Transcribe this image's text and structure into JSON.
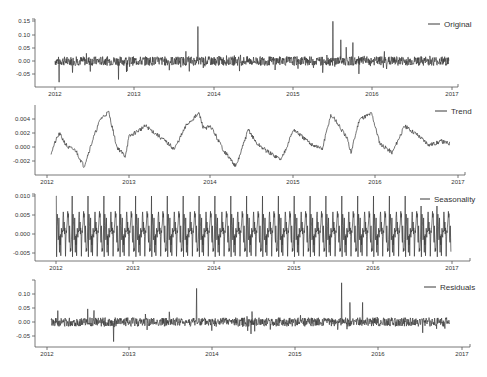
{
  "chart_data": [
    {
      "type": "line",
      "title": "",
      "legend": [
        "Original"
      ],
      "legend_position": "upper right",
      "xlabel": "",
      "ylabel": "",
      "x_ticks": [
        "2012",
        "2013",
        "2014",
        "2015",
        "2016",
        "2017"
      ],
      "y_ticks": [
        "0.15",
        "0.10",
        "0.05",
        "0.00",
        "-0.05"
      ],
      "ylim": [
        -0.09,
        0.16
      ],
      "grid": false,
      "description": "Noisy daily series centered at 0.00, mostly within ±0.03; spikes at ~2012.05 (-0.08), ~2012.8 (-0.07), ~2013.8 (+0.13), ~2015.5 (+0.15), ~2015.6 (+0.08), ~2015.75 (+0.07)",
      "series": [
        {
          "name": "Original",
          "x": [
            2012.0,
            2012.05,
            2012.3,
            2012.6,
            2012.8,
            2013.0,
            2013.3,
            2013.6,
            2013.8,
            2014.0,
            2014.3,
            2014.6,
            2015.0,
            2015.3,
            2015.5,
            2015.6,
            2015.75,
            2016.0,
            2016.3,
            2016.6,
            2016.9
          ],
          "values": [
            0.0,
            -0.08,
            0.01,
            0.02,
            -0.07,
            0.0,
            0.01,
            0.0,
            0.13,
            0.0,
            -0.02,
            0.01,
            0.0,
            0.01,
            0.15,
            0.08,
            0.07,
            0.0,
            0.01,
            -0.02,
            0.0
          ]
        }
      ]
    },
    {
      "type": "line",
      "title": "",
      "legend": [
        "Trend"
      ],
      "legend_position": "upper right",
      "x_ticks": [
        "2012",
        "2013",
        "2014",
        "2015",
        "2016",
        "2017"
      ],
      "y_ticks": [
        "0.004",
        "0.002",
        "0.000",
        "-0.002"
      ],
      "ylim": [
        -0.0035,
        0.0055
      ],
      "grid": false,
      "series": [
        {
          "name": "Trend",
          "x": [
            2012.05,
            2012.1,
            2012.15,
            2012.25,
            2012.35,
            2012.45,
            2012.55,
            2012.65,
            2012.75,
            2012.85,
            2012.95,
            2013.0,
            2013.2,
            2013.4,
            2013.55,
            2013.7,
            2013.85,
            2013.9,
            2014.0,
            2014.15,
            2014.3,
            2014.45,
            2014.55,
            2014.7,
            2014.85,
            2015.0,
            2015.1,
            2015.2,
            2015.35,
            2015.45,
            2015.5,
            2015.65,
            2015.7,
            2015.8,
            2015.95,
            2016.05,
            2016.2,
            2016.35,
            2016.5,
            2016.65,
            2016.8,
            2016.9
          ],
          "values": [
            -0.0008,
            0.0007,
            0.0019,
            0.0,
            -0.0005,
            -0.0028,
            0.0008,
            0.004,
            0.005,
            0.0,
            -0.0013,
            0.0015,
            0.003,
            0.0012,
            -0.0003,
            0.0032,
            0.0048,
            0.0028,
            0.0028,
            -0.0005,
            -0.0028,
            0.0025,
            0.0005,
            -0.0008,
            -0.0018,
            0.0025,
            0.0015,
            0.0005,
            -0.0003,
            0.0045,
            0.004,
            0.0012,
            -0.0008,
            0.004,
            0.0048,
            0.0005,
            -0.0008,
            0.003,
            0.0018,
            0.0003,
            0.0008,
            0.0005
          ]
        }
      ]
    },
    {
      "type": "line",
      "title": "",
      "legend": [
        "Seasonality"
      ],
      "legend_position": "upper right",
      "x_ticks": [
        "2012",
        "2013",
        "2014",
        "2015",
        "2016",
        "2017"
      ],
      "y_ticks": [
        "0.010",
        "0.005",
        "0.000",
        "-0.005"
      ],
      "ylim": [
        -0.007,
        0.0105
      ],
      "grid": false,
      "description": "Periodic (~monthly) pattern repeating across 2012–2017; oscillates between about -0.004 and +0.005 with recurring sharp spikes to +0.010 and -0.006 roughly every 0.2 years",
      "series": [
        {
          "name": "Seasonality",
          "period_years": 0.2,
          "peak": 0.01,
          "trough": -0.006,
          "typical_range": [
            -0.004,
            0.005
          ]
        }
      ]
    },
    {
      "type": "line",
      "title": "",
      "legend": [
        "Residuals"
      ],
      "legend_position": "upper right",
      "x_ticks": [
        "2012",
        "2013",
        "2014",
        "2015",
        "2016",
        "2017"
      ],
      "y_ticks": [
        "0.10",
        "0.05",
        "0.00",
        "-0.05"
      ],
      "ylim": [
        -0.09,
        0.14
      ],
      "grid": false,
      "description": "Noise around 0.00 mostly within ±0.03; spikes at ~2012.8 (-0.07), ~2013.8 (+0.12), ~2015.55 (+0.14), ~2015.65 (+0.07), ~2015.8 (+0.07)",
      "series": [
        {
          "name": "Residuals",
          "x": [
            2012.05,
            2012.3,
            2012.6,
            2012.8,
            2013.0,
            2013.3,
            2013.6,
            2013.8,
            2014.0,
            2014.3,
            2014.6,
            2015.0,
            2015.3,
            2015.55,
            2015.65,
            2015.8,
            2016.0,
            2016.3,
            2016.6,
            2016.9
          ],
          "values": [
            0.0,
            0.02,
            0.01,
            -0.07,
            0.0,
            0.01,
            0.0,
            0.12,
            0.0,
            -0.02,
            0.01,
            0.0,
            0.01,
            0.14,
            0.07,
            0.07,
            0.0,
            0.01,
            -0.02,
            0.0
          ]
        }
      ]
    }
  ],
  "panels": [
    {
      "legend": "Original",
      "y_ticks": [
        "0.15",
        "0.10",
        "0.05",
        "0.00",
        "-0.05"
      ],
      "x_ticks": [
        "2012",
        "2013",
        "2014",
        "2015",
        "2016",
        "2017"
      ]
    },
    {
      "legend": "Trend",
      "y_ticks": [
        "0.004",
        "0.002",
        "0.000",
        "-0.002"
      ],
      "x_ticks": [
        "2012",
        "2013",
        "2014",
        "2015",
        "2016",
        "2017"
      ]
    },
    {
      "legend": "Seasonality",
      "y_ticks": [
        "0.010",
        "0.005",
        "0.000",
        "-0.005"
      ],
      "x_ticks": [
        "2012",
        "2013",
        "2014",
        "2015",
        "2016",
        "2017"
      ]
    },
    {
      "legend": "Residuals",
      "y_ticks": [
        "0.10",
        "0.05",
        "0.00",
        "-0.05"
      ],
      "x_ticks": [
        "2012",
        "2013",
        "2014",
        "2015",
        "2016",
        "2017"
      ]
    }
  ],
  "colors": {
    "line": "#3a3a3a",
    "axis": "#555555",
    "text": "#333333"
  }
}
